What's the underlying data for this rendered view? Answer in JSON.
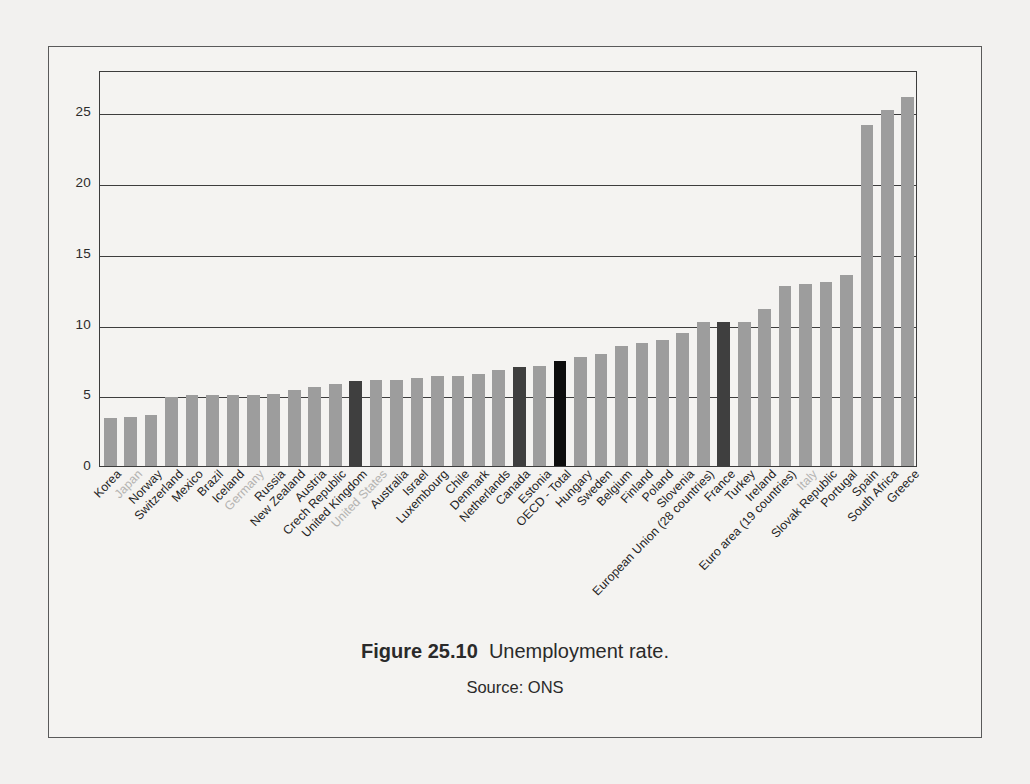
{
  "caption": {
    "figure_number": "Figure 25.10",
    "title": "Unemployment rate.",
    "source": "Source: ONS"
  },
  "colors": {
    "bar_default": "#9d9d9d",
    "bar_highlight_dark": "#3f3f3f",
    "bar_highlight_black": "#0d0d0d",
    "muted_label": "#b3b2b0",
    "axis": "#3d3d3d",
    "page_background": "#f2f1ef"
  },
  "chart_data": {
    "type": "bar",
    "title": "Unemployment rate.",
    "xlabel": "",
    "ylabel": "",
    "ylim": [
      0,
      28
    ],
    "yticks": [
      0,
      5,
      10,
      15,
      20,
      25
    ],
    "grid": true,
    "legend": "none",
    "categories": [
      "Korea",
      "Japan",
      "Norway",
      "Switzerland",
      "Mexico",
      "Brazil",
      "Iceland",
      "Germany",
      "Russia",
      "New Zealand",
      "Austria",
      "Crech Republic",
      "United Kingdom",
      "United States",
      "Australia",
      "Israel",
      "Luxembourg",
      "Chile",
      "Denmark",
      "Netherlands",
      "Canada",
      "Estonia",
      "OECD - Total",
      "Hungary",
      "Sweden",
      "Belgium",
      "Finland",
      "Poland",
      "Slovenia",
      "European Union (28 countries)",
      "France",
      "Turkey",
      "Ireland",
      "Euro area (19 countries)",
      "Italy",
      "Slovak Republic",
      "Portugal",
      "Spain",
      "South Africa",
      "Greece"
    ],
    "values": [
      3.4,
      3.5,
      3.6,
      4.9,
      5.0,
      5.0,
      5.0,
      5.0,
      5.1,
      5.4,
      5.6,
      5.8,
      6.0,
      6.1,
      6.1,
      6.2,
      6.4,
      6.4,
      6.5,
      6.8,
      7.0,
      7.1,
      7.4,
      7.7,
      7.9,
      8.5,
      8.7,
      8.9,
      9.4,
      10.2,
      10.2,
      10.2,
      11.1,
      12.7,
      12.9,
      13.0,
      13.5,
      24.1,
      25.2,
      26.1
    ],
    "bar_styles": [
      "default",
      "muted",
      "default",
      "default",
      "default",
      "default",
      "default",
      "muted",
      "default",
      "default",
      "default",
      "default",
      "dark",
      "muted",
      "default",
      "default",
      "default",
      "default",
      "default",
      "default",
      "dark",
      "default",
      "black",
      "default",
      "default",
      "default",
      "default",
      "default",
      "default",
      "default",
      "dark",
      "default",
      "default",
      "default",
      "muted",
      "default",
      "default",
      "default",
      "default",
      "default"
    ]
  }
}
